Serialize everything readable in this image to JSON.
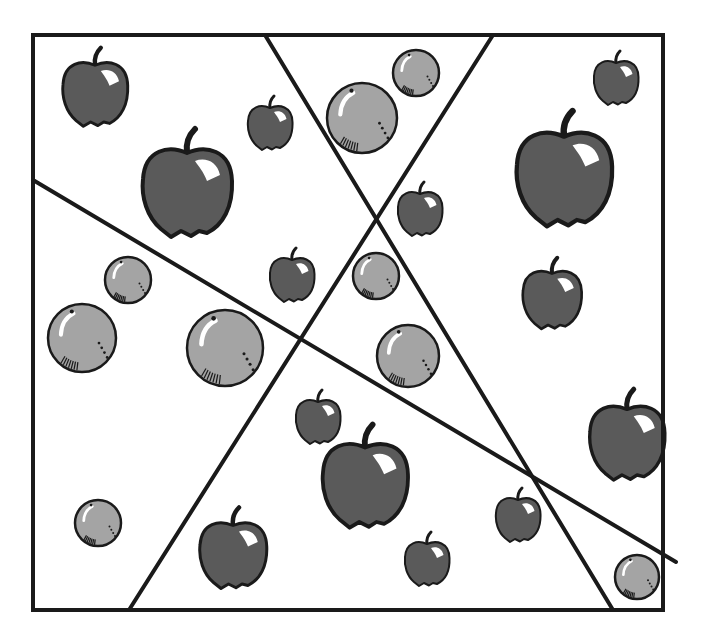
{
  "figure": {
    "frame": {
      "x1": 33,
      "y1": 35,
      "x2": 663,
      "y2": 610
    },
    "colors": {
      "line": "#1a1a1a",
      "apple_fill": "#5a5a5a",
      "orange_fill": "#a4a4a4",
      "background": "#ffffff",
      "highlight": "#ffffff"
    },
    "lines": [
      {
        "name": "line-a",
        "x1": 265,
        "y1": 35,
        "x2": 613,
        "y2": 610
      },
      {
        "name": "line-b",
        "x1": 493,
        "y1": 35,
        "x2": 129,
        "y2": 610
      },
      {
        "name": "line-c",
        "x1": 33,
        "y1": 180,
        "x2": 676,
        "y2": 562
      }
    ],
    "apples": [
      {
        "cx": 95,
        "cy": 90,
        "r": 32
      },
      {
        "cx": 187,
        "cy": 187,
        "r": 44
      },
      {
        "cx": 270,
        "cy": 125,
        "r": 22
      },
      {
        "cx": 292,
        "cy": 277,
        "r": 22
      },
      {
        "cx": 420,
        "cy": 211,
        "r": 22
      },
      {
        "cx": 616,
        "cy": 80,
        "r": 22
      },
      {
        "cx": 564,
        "cy": 173,
        "r": 47
      },
      {
        "cx": 552,
        "cy": 296,
        "r": 29
      },
      {
        "cx": 627,
        "cy": 438,
        "r": 37
      },
      {
        "cx": 318,
        "cy": 419,
        "r": 22
      },
      {
        "cx": 365,
        "cy": 480,
        "r": 42
      },
      {
        "cx": 233,
        "cy": 551,
        "r": 33
      },
      {
        "cx": 427,
        "cy": 561,
        "r": 22
      },
      {
        "cx": 518,
        "cy": 517,
        "r": 22
      }
    ],
    "oranges": [
      {
        "cx": 416,
        "cy": 73,
        "r": 23
      },
      {
        "cx": 362,
        "cy": 118,
        "r": 35
      },
      {
        "cx": 128,
        "cy": 280,
        "r": 23
      },
      {
        "cx": 82,
        "cy": 338,
        "r": 34
      },
      {
        "cx": 225,
        "cy": 348,
        "r": 38
      },
      {
        "cx": 376,
        "cy": 276,
        "r": 23
      },
      {
        "cx": 408,
        "cy": 356,
        "r": 31
      },
      {
        "cx": 98,
        "cy": 523,
        "r": 23
      },
      {
        "cx": 637,
        "cy": 577,
        "r": 22
      }
    ],
    "counts": {
      "apples": 14,
      "oranges": 9
    }
  }
}
